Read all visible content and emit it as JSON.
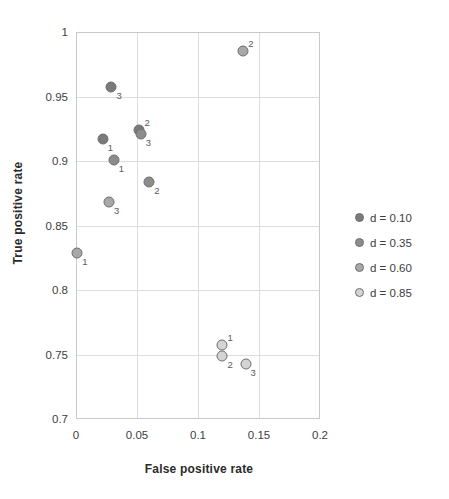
{
  "chart_data": {
    "type": "scatter",
    "title": "",
    "xlabel": "False positive rate",
    "ylabel": "True positive rate",
    "xlim": [
      0,
      0.2
    ],
    "ylim": [
      0.7,
      1
    ],
    "xticks": [
      "0",
      "0.05",
      "0.1",
      "0.15",
      "0.2"
    ],
    "xtick_values": [
      0,
      0.05,
      0.1,
      0.15,
      0.2
    ],
    "yticks": [
      "0.7",
      "0.75",
      "0.8",
      "0.85",
      "0.9",
      "0.95",
      "1"
    ],
    "ytick_values": [
      0.7,
      0.75,
      0.8,
      0.85,
      0.9,
      0.95,
      1
    ],
    "grid": true,
    "legend_position": "right",
    "series": [
      {
        "name": "d = 0.10",
        "color": "#7a7a7a",
        "points": [
          {
            "label": "1",
            "x": 0.022,
            "y": 0.917
          },
          {
            "label": "2",
            "x": 0.052,
            "y": 0.924
          },
          {
            "label": "3",
            "x": 0.029,
            "y": 0.957
          }
        ]
      },
      {
        "name": "d = 0.35",
        "color": "#8c8c8c",
        "points": [
          {
            "label": "1",
            "x": 0.031,
            "y": 0.901
          },
          {
            "label": "2",
            "x": 0.06,
            "y": 0.884
          },
          {
            "label": "3",
            "x": 0.053,
            "y": 0.921
          }
        ]
      },
      {
        "name": "d = 0.60",
        "color": "#a8a8a8",
        "points": [
          {
            "label": "1",
            "x": 0.001,
            "y": 0.829
          },
          {
            "label": "2",
            "x": 0.137,
            "y": 0.985
          },
          {
            "label": "3",
            "x": 0.027,
            "y": 0.868
          }
        ]
      },
      {
        "name": "d = 0.85",
        "color": "#d4d4d4",
        "points": [
          {
            "label": "1",
            "x": 0.12,
            "y": 0.757
          },
          {
            "label": "2",
            "x": 0.12,
            "y": 0.749
          },
          {
            "label": "3",
            "x": 0.139,
            "y": 0.743
          }
        ]
      }
    ]
  },
  "legend": {
    "entries": [
      {
        "label": "d = 0.10",
        "color": "#7a7a7a"
      },
      {
        "label": "d = 0.35",
        "color": "#8c8c8c"
      },
      {
        "label": "d = 0.60",
        "color": "#a8a8a8"
      },
      {
        "label": "d = 0.85",
        "color": "#d4d4d4"
      }
    ]
  }
}
